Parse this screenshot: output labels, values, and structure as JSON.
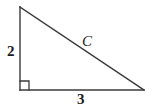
{
  "figure": {
    "kind": "right-triangle",
    "background_color": "#ffffff",
    "stroke_color": "#3a3a3a",
    "label_color": "#1a1a1a",
    "stroke_width": 1.4
  },
  "labels": {
    "vertical_leg": "2",
    "horizontal_leg": "3",
    "hypotenuse": "C"
  },
  "geometry": {
    "apex": {
      "x": 20,
      "y": 7
    },
    "right_angle_vertex": {
      "x": 20,
      "y": 90
    },
    "far_vertex": {
      "x": 144,
      "y": 90
    },
    "right_angle_marker": {
      "x": 20,
      "y": 81,
      "size": 9
    }
  }
}
